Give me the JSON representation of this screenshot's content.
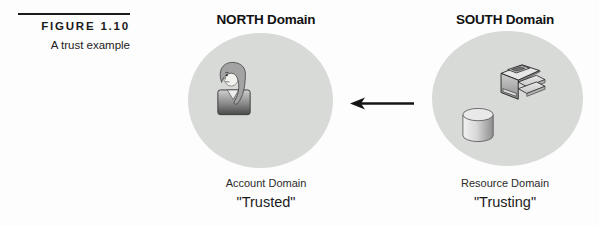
{
  "figure": {
    "label": "FIGURE 1.10",
    "caption": "A trust example"
  },
  "diagram": {
    "north": {
      "title": "NORTH Domain",
      "role_label": "Account Domain",
      "trust_label": "\"Trusted\"",
      "icon": "user-icon"
    },
    "south": {
      "title": "SOUTH Domain",
      "role_label": "Resource Domain",
      "trust_label": "\"Trusting\"",
      "icons": [
        "printer-icon",
        "disk-icon"
      ]
    },
    "arrow": {
      "direction": "left",
      "from": "SOUTH Domain",
      "to": "NORTH Domain"
    }
  },
  "colors": {
    "background": "#fdfdfd",
    "circle_fill": "#d8dad8",
    "text": "#1b1b1b",
    "arrow": "#141414"
  }
}
